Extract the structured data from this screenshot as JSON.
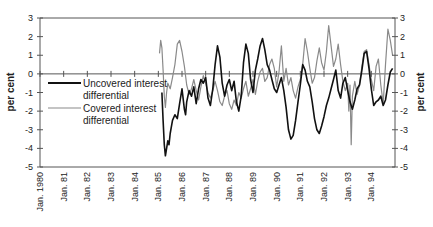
{
  "chart_data": {
    "type": "line",
    "title": "",
    "xlabel": "",
    "ylabel": "per cent",
    "ylabel_right": "per cent",
    "ylim": [
      -5,
      3
    ],
    "yticks": [
      3,
      2,
      1,
      0,
      -1,
      -2,
      -3,
      -4,
      -5
    ],
    "xlim": [
      1980.0,
      1995.0
    ],
    "xtick_labels": [
      "Jan. 1980",
      "Jan. 81",
      "Jan. 82",
      "Jan. 83",
      "Jan. 84",
      "Jan. 85",
      "Jan. 86",
      "Jan. 87",
      "Jan. 88",
      "Jan. 89",
      "Jan. 90",
      "Jan. 91",
      "Jan. 92",
      "Jan. 93",
      "Jan. 94"
    ],
    "grid": false,
    "zero_line": true,
    "legend_position": "inside upper-left, below zero line",
    "series": [
      {
        "name": "Uncovered interest differential",
        "color": "#111111",
        "width": 1.6,
        "x": [
          1985.15,
          1985.2,
          1985.25,
          1985.3,
          1985.35,
          1985.4,
          1985.45,
          1985.5,
          1985.6,
          1985.7,
          1985.8,
          1985.9,
          1986.0,
          1986.1,
          1986.15,
          1986.2,
          1986.3,
          1986.4,
          1986.5,
          1986.6,
          1986.7,
          1986.8,
          1986.9,
          1987.0,
          1987.1,
          1987.2,
          1987.3,
          1987.4,
          1987.5,
          1987.6,
          1987.7,
          1987.8,
          1987.9,
          1988.0,
          1988.1,
          1988.2,
          1988.3,
          1988.4,
          1988.5,
          1988.6,
          1988.7,
          1988.8,
          1988.9,
          1989.0,
          1989.1,
          1989.2,
          1989.3,
          1989.4,
          1989.5,
          1989.6,
          1989.7,
          1989.8,
          1989.9,
          1990.0,
          1990.1,
          1990.2,
          1990.3,
          1990.4,
          1990.5,
          1990.6,
          1990.7,
          1990.8,
          1990.9,
          1991.0,
          1991.1,
          1991.2,
          1991.3,
          1991.4,
          1991.5,
          1991.6,
          1991.7,
          1991.8,
          1991.9,
          1992.0,
          1992.1,
          1992.2,
          1992.3,
          1992.4,
          1992.5,
          1992.6,
          1992.7,
          1992.8,
          1992.9,
          1993.0,
          1993.1,
          1993.2,
          1993.3,
          1993.4,
          1993.5,
          1993.6,
          1993.7,
          1993.8,
          1993.9,
          1994.0,
          1994.1,
          1994.2,
          1994.3,
          1994.4,
          1994.5,
          1994.6,
          1994.7,
          1994.8,
          1994.9
        ],
        "values": [
          -1.0,
          -2.5,
          -3.8,
          -4.4,
          -4.0,
          -3.6,
          -3.8,
          -3.2,
          -2.5,
          -2.2,
          -2.4,
          -1.6,
          -0.8,
          -1.9,
          -2.2,
          -1.5,
          -0.9,
          -1.2,
          -0.7,
          -1.6,
          -0.8,
          -0.3,
          -0.5,
          -0.2,
          -1.3,
          -1.7,
          -0.8,
          0.5,
          1.5,
          0.9,
          -0.5,
          -1.2,
          -0.6,
          -0.3,
          -0.9,
          -0.4,
          -1.5,
          -2.0,
          -1.2,
          0.6,
          1.6,
          1.1,
          -0.3,
          -1.0,
          0.2,
          0.8,
          1.5,
          1.9,
          1.3,
          0.5,
          0.2,
          -0.3,
          -0.8,
          -1.0,
          -0.6,
          -0.2,
          -0.9,
          -1.8,
          -3.0,
          -3.5,
          -3.3,
          -2.5,
          -1.5,
          -0.6,
          0.5,
          0.2,
          -0.4,
          -0.7,
          -1.5,
          -2.4,
          -3.0,
          -3.2,
          -2.8,
          -2.3,
          -1.7,
          -1.3,
          -0.8,
          -0.3,
          0.2,
          -0.9,
          -1.3,
          -0.5,
          -0.2,
          -0.9,
          -1.5,
          -1.9,
          -1.4,
          -0.8,
          -0.6,
          0.2,
          1.1,
          1.2,
          0.3,
          -0.8,
          -1.7,
          -1.5,
          -1.4,
          -1.2,
          -1.7,
          -1.4,
          -0.6,
          0.1,
          0.3
        ]
      },
      {
        "name": "Covered interest differential",
        "color": "#8a8a8a",
        "width": 1.2,
        "x": [
          1985.05,
          1985.1,
          1985.15,
          1985.2,
          1985.25,
          1985.3,
          1985.35,
          1985.4,
          1985.5,
          1985.6,
          1985.7,
          1985.8,
          1985.9,
          1986.0,
          1986.1,
          1986.2,
          1986.3,
          1986.4,
          1986.5,
          1986.6,
          1986.7,
          1986.8,
          1986.9,
          1987.0,
          1987.1,
          1987.2,
          1987.3,
          1987.4,
          1987.5,
          1987.6,
          1987.7,
          1987.8,
          1987.9,
          1988.0,
          1988.1,
          1988.2,
          1988.3,
          1988.4,
          1988.5,
          1988.6,
          1988.7,
          1988.8,
          1988.9,
          1989.0,
          1989.1,
          1989.2,
          1989.3,
          1989.4,
          1989.5,
          1989.6,
          1989.7,
          1989.8,
          1989.9,
          1990.0,
          1990.1,
          1990.2,
          1990.3,
          1990.4,
          1990.5,
          1990.6,
          1990.7,
          1990.8,
          1990.9,
          1991.0,
          1991.1,
          1991.2,
          1991.3,
          1991.4,
          1991.5,
          1991.6,
          1991.7,
          1991.8,
          1991.9,
          1992.0,
          1992.1,
          1992.2,
          1992.3,
          1992.4,
          1992.5,
          1992.6,
          1992.7,
          1992.8,
          1992.9,
          1993.0,
          1993.05,
          1993.1,
          1993.15,
          1993.2,
          1993.3,
          1993.4,
          1993.5,
          1993.6,
          1993.7,
          1993.8,
          1993.9,
          1994.0,
          1994.1,
          1994.2,
          1994.3,
          1994.4,
          1994.5,
          1994.6,
          1994.7,
          1994.8,
          1994.9
        ],
        "values": [
          1.1,
          1.8,
          1.4,
          0.2,
          -1.2,
          -1.8,
          -1.0,
          -0.5,
          -0.8,
          -0.2,
          0.5,
          1.6,
          1.8,
          1.2,
          0.4,
          -0.6,
          -1.1,
          -0.8,
          -0.3,
          -0.9,
          -1.4,
          -0.7,
          -0.1,
          -0.5,
          -1.0,
          -1.3,
          -0.9,
          -0.4,
          -0.9,
          -1.5,
          -1.7,
          -1.2,
          -0.9,
          -1.6,
          -1.9,
          -1.4,
          -1.7,
          -1.0,
          -1.3,
          -0.8,
          -0.4,
          -1.2,
          -0.8,
          -0.3,
          -1.1,
          -0.4,
          0.1,
          0.3,
          -0.4,
          -0.2,
          0.5,
          0.8,
          0.3,
          -0.7,
          0.1,
          1.5,
          -0.4,
          0.3,
          -0.6,
          -0.2,
          -0.9,
          -1.3,
          -0.7,
          -0.3,
          0.5,
          1.9,
          1.2,
          0.3,
          -0.5,
          -0.2,
          0.7,
          1.4,
          0.6,
          0.2,
          1.2,
          2.6,
          1.5,
          0.4,
          0.8,
          1.6,
          0.5,
          -0.4,
          -0.9,
          -0.5,
          -2.0,
          -0.6,
          -3.8,
          -1.2,
          -0.4,
          -1.1,
          -0.6,
          0.4,
          1.2,
          1.3,
          0.5,
          -0.3,
          -0.9,
          0.4,
          0.8,
          -0.6,
          -1.6,
          0.5,
          2.4,
          1.8,
          1.0
        ]
      }
    ]
  },
  "axes": {
    "left_title": "per cent",
    "right_title": "per cent",
    "ytick_labels": [
      "3",
      "2",
      "1",
      "0",
      "-1",
      "-2",
      "-3",
      "-4",
      "-5"
    ]
  },
  "legend": {
    "items": [
      {
        "line1": "Uncovered interest",
        "line2": "differential",
        "color": "#111111"
      },
      {
        "line1": "Covered interest",
        "line2": "differential",
        "color": "#8a8a8a"
      }
    ]
  }
}
